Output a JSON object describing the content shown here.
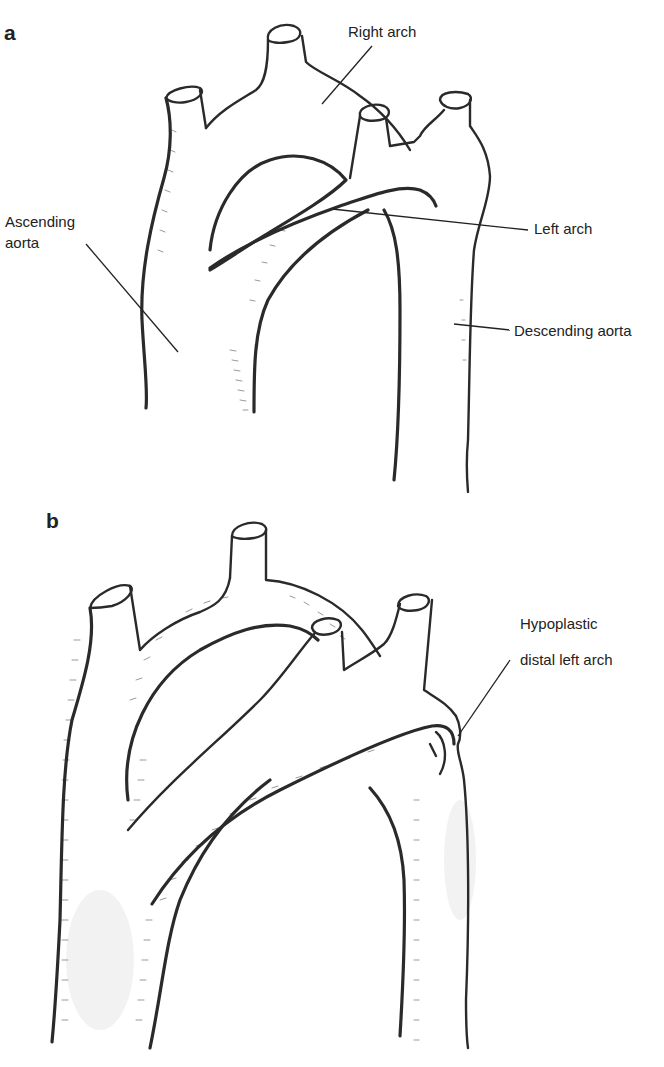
{
  "figure": {
    "panel_a": {
      "letter": "a",
      "labels": {
        "right_arch": "Right arch",
        "ascending_aorta_line1": "Ascending",
        "ascending_aorta_line2": "aorta",
        "left_arch": "Left arch",
        "descending_aorta": "Descending aorta"
      }
    },
    "panel_b": {
      "letter": "b",
      "labels": {
        "hypoplastic_line1": "Hypoplastic",
        "hypoplastic_line2": "distal left arch"
      }
    }
  }
}
